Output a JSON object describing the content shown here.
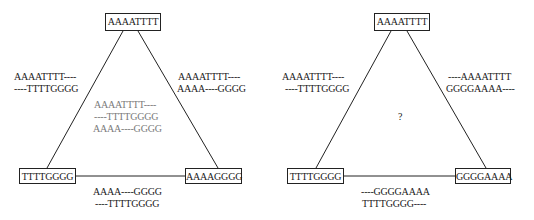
{
  "diagrams": [
    {
      "nodes": {
        "top": "AAAATTTT",
        "bottom_left": "TTTTGGGG",
        "bottom_right": "AAAAGGGG"
      },
      "edges": {
        "left": [
          "AAAATTTT----",
          "----TTTTGGGG"
        ],
        "right": [
          "AAAATTTT----",
          "AAAA----GGGG"
        ],
        "bottom": [
          "AAAA----GGGG",
          "----TTTTGGGG"
        ]
      },
      "center": [
        "AAAATTTT----",
        "----TTTTGGGG",
        "AAAA----GGGG"
      ]
    },
    {
      "nodes": {
        "top": "AAAATTTT",
        "bottom_left": "TTTTGGGG",
        "bottom_right": "GGGGAAAA"
      },
      "edges": {
        "left": [
          "AAAATTTT----",
          "----TTTTGGGG"
        ],
        "right": [
          "----AAAATTTT",
          "GGGGAAAA----"
        ],
        "bottom": [
          "----GGGGAAAA",
          "TTTTGGGG----"
        ]
      },
      "center": "?"
    }
  ],
  "colors": {
    "line": "#222222",
    "text": "#1a1a1a",
    "center_text": "#7a7a7a"
  }
}
